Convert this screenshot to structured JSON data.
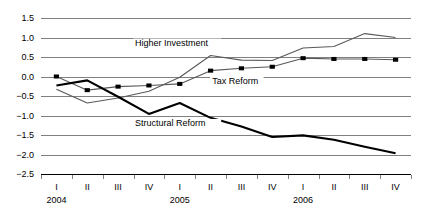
{
  "chart_data": {
    "type": "line",
    "title": "",
    "xlabel": "",
    "ylabel": "",
    "ylim": [
      -2.5,
      1.5
    ],
    "ytick_step": 0.5,
    "yticks": [
      "1.5",
      "1.0",
      "0.5",
      "0.0",
      "-0.5",
      "-1.0",
      "-1.5",
      "-2.0",
      "-2.5"
    ],
    "ytick_values": [
      1.5,
      1.0,
      0.5,
      0.0,
      -0.5,
      -1.0,
      -1.5,
      -2.0,
      -2.5
    ],
    "grid": "horizontal",
    "legend_position": "inline-annotations",
    "categories": [
      "I",
      "II",
      "III",
      "IV",
      "I",
      "II",
      "III",
      "IV",
      "I",
      "II",
      "III",
      "IV"
    ],
    "group_labels": [
      {
        "label": "2004",
        "start_index": 0,
        "span": 4
      },
      {
        "label": "2005",
        "start_index": 4,
        "span": 4
      },
      {
        "label": "2006",
        "start_index": 8,
        "span": 4
      }
    ],
    "series": [
      {
        "name": "Higher Investment",
        "style": "thin-line",
        "color": "#595959",
        "markers": false,
        "values": [
          -0.33,
          -0.68,
          -0.55,
          -0.38,
          -0.02,
          0.54,
          0.42,
          0.41,
          0.73,
          0.77,
          1.1,
          1.0
        ]
      },
      {
        "name": "Tax Reform",
        "style": "thin-line-with-square-markers",
        "color": "#595959",
        "markers": true,
        "values": [
          0.0,
          -0.35,
          -0.26,
          -0.23,
          -0.19,
          0.15,
          0.21,
          0.25,
          0.47,
          0.45,
          0.45,
          0.43
        ]
      },
      {
        "name": "Structural Reform",
        "style": "thick-line",
        "color": "#000000",
        "markers": false,
        "values": [
          -0.23,
          -0.1,
          -0.52,
          -0.96,
          -0.68,
          -1.06,
          -1.28,
          -1.55,
          -1.51,
          -1.62,
          -1.8,
          -1.97
        ]
      }
    ],
    "annotations": [
      {
        "text": "Higher Investment",
        "x_index": 2.55,
        "value": 0.78
      },
      {
        "text": "Tax Reform",
        "x_index": 5.05,
        "value": -0.2
      },
      {
        "text": "Structural Reform",
        "x_index": 2.55,
        "value": -1.28
      }
    ]
  }
}
